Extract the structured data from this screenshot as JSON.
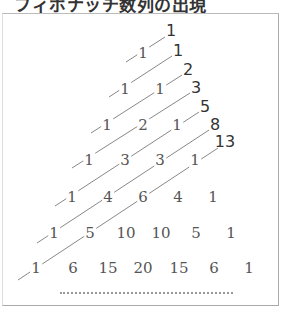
{
  "title": "フィボナッチ数列の出現",
  "pascal_rows": [
    [
      "1"
    ],
    [
      "1",
      "1"
    ],
    [
      "1",
      "2",
      "1"
    ],
    [
      "1",
      "3",
      "3",
      "1"
    ],
    [
      "1",
      "4",
      "6",
      "4",
      "1"
    ],
    [
      "1",
      "5",
      "10",
      "10",
      "5",
      "1"
    ],
    [
      "1",
      "6",
      "15",
      "20",
      "15",
      "6",
      "1"
    ]
  ],
  "fibonacci": [
    "1",
    "1",
    "2",
    "3",
    "5",
    "8",
    "13"
  ],
  "continuation": "……",
  "colors": {
    "pascal_text": "#555555",
    "fibonacci_text": "#333333",
    "line": "#888888",
    "border": "#aaaaaa"
  }
}
